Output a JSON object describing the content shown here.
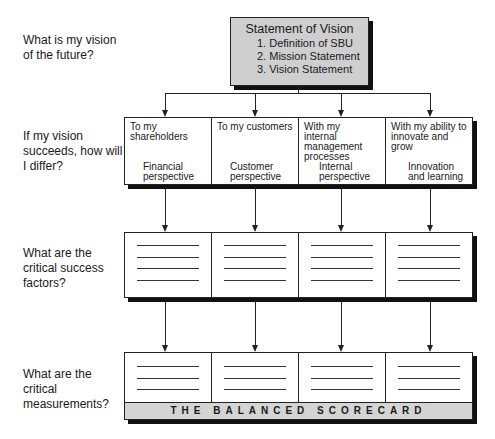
{
  "questions": [
    "What is my vision of the future?",
    "If my vision succeeds, how will I differ?",
    "What are the critical success factors?",
    "What are the critical measurements?"
  ],
  "vision": {
    "title": "Statement of Vision",
    "items": [
      "1. Definition of SBU",
      "2. Mission Statement",
      "3. Vision Statement"
    ]
  },
  "perspectives": [
    {
      "to": "To my shareholders",
      "name": "Financial perspective"
    },
    {
      "to": "To my customers",
      "name": "Customer perspective"
    },
    {
      "to": "With my internal management processes",
      "name": "Internal perspective"
    },
    {
      "to": "With my ability to innovate and grow",
      "name": "Innovation and learning"
    }
  ],
  "scorecard": {
    "banner": "THE BALANCED SCORECARD"
  }
}
